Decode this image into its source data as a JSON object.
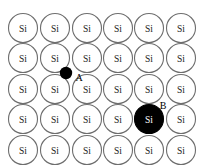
{
  "figure": {
    "background_color": "#ffffff",
    "width": 202,
    "height": 168
  },
  "lattice": {
    "rows": 5,
    "columns": 6,
    "atom_label": "Si",
    "outline_color": "#6e6e6e",
    "fill_color": "#ffffff",
    "label_color": "#1a1a1a",
    "radius": 14.5,
    "col_centers": [
      23,
      55,
      87,
      118,
      149,
      181
    ],
    "row_centers": [
      28,
      58,
      89,
      119,
      150
    ],
    "sites": [
      {
        "row": 0,
        "col": 0,
        "label": "Si",
        "state": "normal"
      },
      {
        "row": 0,
        "col": 1,
        "label": "Si",
        "state": "normal"
      },
      {
        "row": 0,
        "col": 2,
        "label": "Si",
        "state": "normal"
      },
      {
        "row": 0,
        "col": 3,
        "label": "Si",
        "state": "normal"
      },
      {
        "row": 0,
        "col": 4,
        "label": "Si",
        "state": "normal"
      },
      {
        "row": 0,
        "col": 5,
        "label": "Si",
        "state": "normal"
      },
      {
        "row": 1,
        "col": 0,
        "label": "Si",
        "state": "normal"
      },
      {
        "row": 1,
        "col": 1,
        "label": "Si",
        "state": "normal"
      },
      {
        "row": 1,
        "col": 2,
        "label": "Si",
        "state": "normal"
      },
      {
        "row": 1,
        "col": 3,
        "label": "Si",
        "state": "normal"
      },
      {
        "row": 1,
        "col": 4,
        "label": "Si",
        "state": "normal"
      },
      {
        "row": 1,
        "col": 5,
        "label": "Si",
        "state": "normal"
      },
      {
        "row": 2,
        "col": 0,
        "label": "Si",
        "state": "normal"
      },
      {
        "row": 2,
        "col": 1,
        "label": "Si",
        "state": "normal"
      },
      {
        "row": 2,
        "col": 2,
        "label": "Si",
        "state": "normal"
      },
      {
        "row": 2,
        "col": 3,
        "label": "Si",
        "state": "normal"
      },
      {
        "row": 2,
        "col": 4,
        "label": "Si",
        "state": "normal"
      },
      {
        "row": 2,
        "col": 5,
        "label": "Si",
        "state": "normal"
      },
      {
        "row": 3,
        "col": 0,
        "label": "Si",
        "state": "normal"
      },
      {
        "row": 3,
        "col": 1,
        "label": "Si",
        "state": "normal"
      },
      {
        "row": 3,
        "col": 2,
        "label": "Si",
        "state": "normal"
      },
      {
        "row": 3,
        "col": 3,
        "label": "Si",
        "state": "normal"
      },
      {
        "row": 3,
        "col": 4,
        "label": "Si",
        "state": "filled"
      },
      {
        "row": 3,
        "col": 5,
        "label": "Si",
        "state": "normal"
      },
      {
        "row": 4,
        "col": 0,
        "label": "Si",
        "state": "normal"
      },
      {
        "row": 4,
        "col": 1,
        "label": "Si",
        "state": "normal"
      },
      {
        "row": 4,
        "col": 2,
        "label": "Si",
        "state": "normal"
      },
      {
        "row": 4,
        "col": 3,
        "label": "Si",
        "state": "normal"
      },
      {
        "row": 4,
        "col": 4,
        "label": "Si",
        "state": "normal"
      },
      {
        "row": 4,
        "col": 5,
        "label": "Si",
        "state": "normal"
      }
    ]
  },
  "defects": [
    {
      "id": "A",
      "kind": "interstitial-dot",
      "marker_label": "A",
      "color": "#000000",
      "cx": 66,
      "cy": 73,
      "radius": 6.2,
      "label_x": 79,
      "label_y": 77
    },
    {
      "id": "B",
      "kind": "substitutional-atom",
      "marker_label": "B",
      "atom_label": "Si",
      "color": "#000000",
      "label_color": "#ffffff",
      "cx": 149,
      "cy": 119,
      "radius": 14.5,
      "label_x": 163,
      "label_y": 105
    }
  ]
}
